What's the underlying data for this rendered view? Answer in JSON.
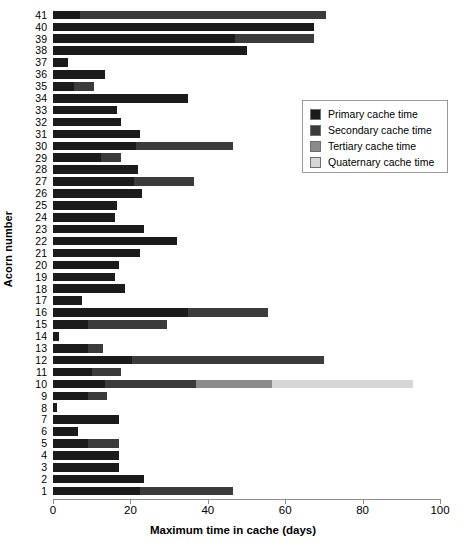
{
  "chart_data": {
    "type": "bar",
    "orientation": "horizontal",
    "stacked": true,
    "title": "",
    "xlabel": "Maximum time in cache (days)",
    "ylabel": "Acorn number",
    "xlim": [
      0,
      100
    ],
    "xticks": [
      0,
      20,
      40,
      60,
      80,
      100
    ],
    "xtick_labels": [
      "0",
      "20",
      "40",
      "60",
      "80",
      "100"
    ],
    "grid": false,
    "legend_position": "upper right",
    "categories": [
      "1",
      "2",
      "3",
      "4",
      "5",
      "6",
      "7",
      "8",
      "9",
      "10",
      "11",
      "12",
      "13",
      "14",
      "15",
      "16",
      "17",
      "18",
      "19",
      "20",
      "21",
      "22",
      "23",
      "24",
      "25",
      "26",
      "27",
      "28",
      "29",
      "30",
      "31",
      "32",
      "33",
      "34",
      "35",
      "36",
      "37",
      "38",
      "39",
      "40",
      "41"
    ],
    "series": [
      {
        "name": "Primary cache time",
        "color": "#1b1b1b",
        "values": [
          22.5,
          23.5,
          17.0,
          17.0,
          9.0,
          6.5,
          17.0,
          1.0,
          9.0,
          13.5,
          10.0,
          20.5,
          9.0,
          1.5,
          9.0,
          35.0,
          7.5,
          18.5,
          16.0,
          17.0,
          22.5,
          32.0,
          23.5,
          16.0,
          16.5,
          23.0,
          21.0,
          22.0,
          12.5,
          21.5,
          22.5,
          17.5,
          16.5,
          35.0,
          5.5,
          13.5,
          4.0,
          50.0,
          47.0,
          67.5,
          7.0
        ]
      },
      {
        "name": "Secondary cache time",
        "color": "#3b3b3b",
        "values": [
          24.0,
          0.0,
          0.0,
          0.0,
          8.0,
          0.0,
          0.0,
          0.0,
          5.0,
          23.5,
          7.5,
          49.5,
          4.0,
          0.0,
          20.5,
          20.5,
          0.0,
          0.0,
          0.0,
          0.0,
          0.0,
          0.0,
          0.0,
          0.0,
          0.0,
          0.0,
          15.5,
          0.0,
          5.0,
          25.0,
          0.0,
          0.0,
          0.0,
          0.0,
          5.0,
          0.0,
          0.0,
          0.0,
          20.5,
          0.0,
          63.5
        ]
      },
      {
        "name": "Tertiary cache time",
        "color": "#8b8b8b",
        "values": [
          0.0,
          0.0,
          0.0,
          0.0,
          0.0,
          0.0,
          0.0,
          0.0,
          0.0,
          19.5,
          0.0,
          0.0,
          0.0,
          0.0,
          0.0,
          0.0,
          0.0,
          0.0,
          0.0,
          0.0,
          0.0,
          0.0,
          0.0,
          0.0,
          0.0,
          0.0,
          0.0,
          0.0,
          0.0,
          0.0,
          0.0,
          0.0,
          0.0,
          0.0,
          0.0,
          0.0,
          0.0,
          0.0,
          0.0,
          0.0,
          0.0
        ]
      },
      {
        "name": "Quaternary cache time",
        "color": "#d6d6d6",
        "values": [
          0.0,
          0.0,
          0.0,
          0.0,
          0.0,
          0.0,
          0.0,
          0.0,
          0.0,
          36.5,
          0.0,
          0.0,
          0.0,
          0.0,
          0.0,
          0.0,
          0.0,
          0.0,
          0.0,
          0.0,
          0.0,
          0.0,
          0.0,
          0.0,
          0.0,
          0.0,
          0.0,
          0.0,
          0.0,
          0.0,
          0.0,
          0.0,
          0.0,
          0.0,
          0.0,
          0.0,
          0.0,
          0.0,
          0.0,
          0.0,
          0.0
        ]
      }
    ]
  },
  "legend": {
    "items": [
      {
        "label": "Primary cache time",
        "color": "#1b1b1b"
      },
      {
        "label": "Secondary cache time",
        "color": "#3b3b3b"
      },
      {
        "label": "Tertiary cache time",
        "color": "#8b8b8b"
      },
      {
        "label": "Quaternary cache time",
        "color": "#d6d6d6"
      }
    ]
  }
}
